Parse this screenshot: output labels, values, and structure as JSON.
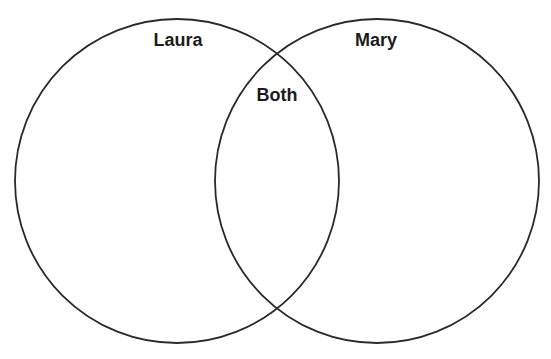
{
  "diagram": {
    "type": "venn",
    "sets": [
      {
        "id": "laura",
        "label": "Laura",
        "cx": 177,
        "cy": 181,
        "r": 162
      },
      {
        "id": "mary",
        "label": "Mary",
        "cx": 377,
        "cy": 181,
        "r": 162
      }
    ],
    "intersection": {
      "label": "Both",
      "sets": [
        "laura",
        "mary"
      ]
    },
    "stroke_color": "#2a2a2a",
    "background": "#ffffff"
  }
}
